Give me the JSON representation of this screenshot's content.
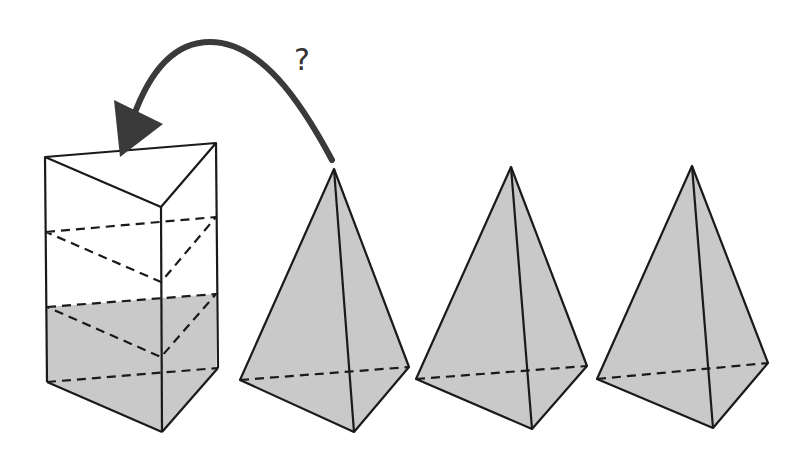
{
  "diagram": {
    "annotation": "?",
    "colors": {
      "fill": "#c9c9c9",
      "stroke": "#1a1a1a",
      "arrow": "#3a3a3a",
      "background": "#ffffff"
    },
    "elements": [
      {
        "id": "prism",
        "label": "triangular prism, bottom third shaded",
        "shaded_fraction": "1/3"
      },
      {
        "id": "pyramid-1",
        "label": "triangular pyramid"
      },
      {
        "id": "pyramid-2",
        "label": "triangular pyramid"
      },
      {
        "id": "pyramid-3",
        "label": "triangular pyramid"
      },
      {
        "id": "arrow",
        "label": "curved arrow from pyramid 1 to prism"
      }
    ]
  }
}
